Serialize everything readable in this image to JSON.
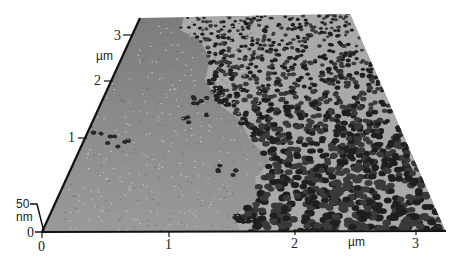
{
  "figure": {
    "type": "AFM 3D surface topography",
    "x_axis": {
      "unit": "µm",
      "ticks": [
        "0",
        "1",
        "2",
        "3"
      ]
    },
    "y_axis": {
      "unit": "µm",
      "ticks": [
        "1",
        "2",
        "3"
      ]
    },
    "z_axis": {
      "unit": "nm",
      "tick_top": "50",
      "tick_bottom": "0"
    },
    "regions": [
      {
        "name": "flat-substrate",
        "description": "smooth grey substrate on left side"
      },
      {
        "name": "nanoparticle-islands",
        "description": "dense dark particle clusters on right side"
      }
    ],
    "colors": {
      "substrate": "#8a8a8a",
      "particle": "#2a2a2a",
      "axis": "#111111"
    }
  }
}
